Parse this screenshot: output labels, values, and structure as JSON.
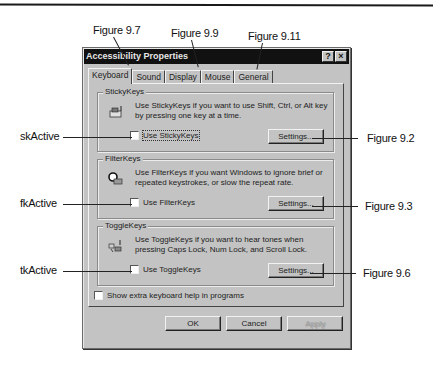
{
  "window": {
    "title": "Accessibility Properties",
    "title_buttons": [
      {
        "name": "help",
        "glyph": "?"
      },
      {
        "name": "close",
        "glyph": "×"
      }
    ]
  },
  "tabs": [
    {
      "label": "Keyboard",
      "active": true
    },
    {
      "label": "Sound",
      "active": false
    },
    {
      "label": "Display",
      "active": false
    },
    {
      "label": "Mouse",
      "active": false
    },
    {
      "label": "General",
      "active": false
    }
  ],
  "groups": {
    "stickykeys": {
      "title": "StickyKeys",
      "icon": "stickykeys-icon",
      "description": "Use StickyKeys if you want to use Shift, Ctrl, or Alt key by pressing one key at a time.",
      "checkbox_label": "Use StickyKeys",
      "checked": false,
      "settings_label": "Settings..."
    },
    "filterkeys": {
      "title": "FilterKeys",
      "icon": "filterkeys-icon",
      "description": "Use FilterKeys if you want Windows to ignore brief or repeated keystrokes, or slow the repeat rate.",
      "checkbox_label": "Use FilterKeys",
      "checked": false,
      "settings_label": "Settings..."
    },
    "togglekeys": {
      "title": "ToggleKeys",
      "icon": "togglekeys-icon",
      "description": "Use ToggleKeys if you want to hear tones when pressing Caps Lock, Num Lock, and Scroll Lock.",
      "checkbox_label": "Use ToggleKeys",
      "checked": false,
      "settings_label": "Settings..."
    }
  },
  "extra_help": {
    "label": "Show extra keyboard help in programs",
    "checked": false
  },
  "footer": {
    "ok_label": "OK",
    "cancel_label": "Cancel",
    "apply_label": "Apply"
  },
  "callouts": {
    "top": [
      "Figure 9.7",
      "Figure 9.9",
      "Figure 9.11"
    ],
    "left": [
      "skActive",
      "fkActive",
      "tkActive"
    ],
    "right": [
      "Figure 9.2",
      "Figure 9.3",
      "Figure 9.6"
    ]
  }
}
